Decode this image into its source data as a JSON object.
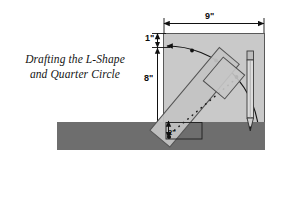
{
  "figure": {
    "caption_line1": "Drafting the L-Shape",
    "caption_line2": "and Quarter Circle",
    "background_color": "#ffffff"
  },
  "dimensions": [
    {
      "id": "width",
      "label": "9\"",
      "orientation": "horizontal",
      "position": "top"
    },
    {
      "id": "top-offset",
      "label": "1\"",
      "orientation": "vertical",
      "position": "left-upper"
    },
    {
      "id": "height",
      "label": "8\"",
      "orientation": "vertical",
      "position": "left"
    },
    {
      "id": "pivot-offset",
      "label": "2\"",
      "orientation": "vertical",
      "position": "lower-left-inset"
    }
  ],
  "colors": {
    "panel_fill": "#c9c9c9",
    "panel_stroke": "#4a4a4a",
    "dark_bar": "#6e6e6e",
    "ruler_fill": "#c4c4c4",
    "ruler_stroke": "#555555",
    "pencil_body": "#d8d8d8",
    "pencil_stroke": "#3b3b3b",
    "arc_stroke": "#1a1a1a",
    "dotted_line": "#202020",
    "text": "#141414"
  },
  "objects": [
    {
      "name": "drawing-panel",
      "shape": "rectangle",
      "note": "light gray square work surface"
    },
    {
      "name": "quarter-arc",
      "shape": "arc",
      "note": "quarter circle with arrowheads at both ends and midpoint"
    },
    {
      "name": "diagonal-ruler",
      "shape": "straightedge",
      "note": "rotated rectangular rule with dotted center line"
    },
    {
      "name": "set-square",
      "shape": "small-square",
      "note": "square block at upper end of ruler"
    },
    {
      "name": "pencil",
      "shape": "pencil",
      "note": "vertical pencil at right side, tip down"
    },
    {
      "name": "workbench-bar",
      "shape": "horizontal-bar",
      "note": "dark gray bench edge"
    },
    {
      "name": "pivot-point",
      "shape": "point",
      "note": "arc center at lower left of panel"
    }
  ]
}
